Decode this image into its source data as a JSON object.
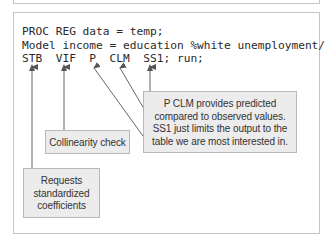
{
  "code": {
    "lines": [
      "PROC REG data = temp;",
      "Model income = education %white unemployment/",
      "STB  VIF  P  CLM  SS1; run;"
    ]
  },
  "annotations": {
    "predicted": {
      "lines": [
        "P CLM provides predicted",
        "compared to observed values.",
        "SS1 just limits the output to the",
        "table we are most interested in."
      ],
      "points_to": [
        "P",
        "CLM",
        "SS1"
      ]
    },
    "collinearity": {
      "lines": [
        "Collinearity check"
      ],
      "points_to": [
        "VIF"
      ]
    },
    "standardized": {
      "lines": [
        "Requests",
        "standardized",
        "coefficients"
      ],
      "points_to": [
        "STB"
      ]
    }
  },
  "colors": {
    "frame_border": "#c4c4c4",
    "note_fill": "#ececec",
    "note_border": "#b8b8b8",
    "arrow": "#555555",
    "text": "#2a2a2a"
  }
}
